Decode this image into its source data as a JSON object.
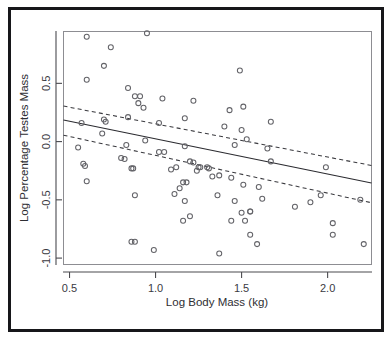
{
  "figure": {
    "background_color": "#ffffff",
    "border_color": "#17171a",
    "panel_border_color": "#8d8d92",
    "point_color": "#636368",
    "line_color": "#2b2b30"
  },
  "chart_data": {
    "type": "scatter",
    "title": "",
    "xlabel": "Log Body Mass (kg)",
    "ylabel": "Log Percentage Testes Mass",
    "xlim": [
      0.465,
      2.255
    ],
    "ylim": [
      -1.055,
      0.945
    ],
    "xticks": [
      0.5,
      1.0,
      1.5,
      2.0
    ],
    "xticklabels": [
      "0.5",
      "1.0",
      "1.5",
      "2.0"
    ],
    "yticks": [
      0.5,
      0.0,
      -0.5,
      -1.0
    ],
    "yticklabels": [
      "0.5",
      "0.0",
      "-0.5",
      "-1.0"
    ],
    "grid": false,
    "legend": false,
    "marker": "open-circle",
    "x": [
      0.6,
      0.74,
      0.7,
      0.95,
      0.6,
      1.49,
      0.84,
      0.88,
      0.9,
      0.91,
      0.93,
      1.04,
      1.17,
      1.22,
      1.43,
      1.51,
      0.7,
      0.71,
      0.84,
      1.02,
      1.17,
      1.4,
      1.67,
      1.5,
      0.57,
      0.69,
      0.83,
      1.05,
      1.2,
      1.46,
      1.53,
      1.65,
      0.55,
      0.8,
      0.82,
      0.86,
      0.87,
      0.94,
      1.09,
      1.12,
      1.16,
      1.24,
      1.25,
      1.3,
      1.33,
      1.37,
      1.44,
      1.51,
      1.6,
      1.67,
      1.99,
      0.58,
      0.59,
      0.6,
      0.88,
      1.02,
      1.11,
      1.14,
      1.18,
      1.22,
      1.26,
      1.31,
      1.46,
      1.55,
      1.62,
      1.81,
      1.9,
      1.96,
      0.86,
      1.16,
      1.17,
      1.2,
      1.36,
      1.44,
      1.5,
      1.52,
      1.55,
      2.03,
      0.88,
      0.99,
      1.59,
      1.55,
      1.37,
      2.03,
      2.21,
      2.19
    ],
    "y": [
      0.9,
      0.81,
      0.65,
      0.93,
      0.53,
      0.61,
      0.46,
      0.39,
      0.33,
      0.39,
      0.29,
      0.37,
      0.2,
      0.35,
      0.27,
      0.3,
      0.19,
      0.17,
      0.21,
      0.16,
      -0.04,
      0.13,
      0.17,
      0.1,
      0.16,
      0.07,
      -0.03,
      -0.09,
      -0.17,
      -0.03,
      0.02,
      -0.06,
      -0.05,
      -0.14,
      -0.15,
      -0.23,
      -0.23,
      0.01,
      -0.24,
      -0.22,
      -0.35,
      -0.25,
      -0.22,
      -0.22,
      -0.3,
      -0.29,
      -0.31,
      -0.37,
      -0.39,
      -0.17,
      -0.22,
      -0.19,
      -0.21,
      -0.34,
      -0.46,
      -0.09,
      -0.45,
      -0.4,
      -0.35,
      -0.18,
      -0.22,
      -0.23,
      -0.51,
      -0.6,
      -0.49,
      -0.56,
      -0.52,
      -0.46,
      -0.86,
      -0.68,
      -0.51,
      -0.64,
      -0.46,
      -0.68,
      -0.61,
      -0.68,
      -0.8,
      -0.8,
      -0.86,
      -0.93,
      -0.88,
      -0.6,
      -0.96,
      -0.7,
      -0.88,
      -0.5
    ],
    "fit_line": {
      "label": "regression-fit",
      "style": "solid",
      "x": [
        0.465,
        2.255
      ],
      "y": [
        0.185,
        -0.355
      ]
    },
    "confidence_bands": [
      {
        "label": "upper-confidence-band",
        "style": "dashed",
        "x": [
          0.465,
          2.255
        ],
        "y": [
          0.305,
          -0.205
        ]
      },
      {
        "label": "lower-confidence-band",
        "style": "dashed",
        "x": [
          0.465,
          2.255
        ],
        "y": [
          0.055,
          -0.525
        ]
      }
    ]
  }
}
